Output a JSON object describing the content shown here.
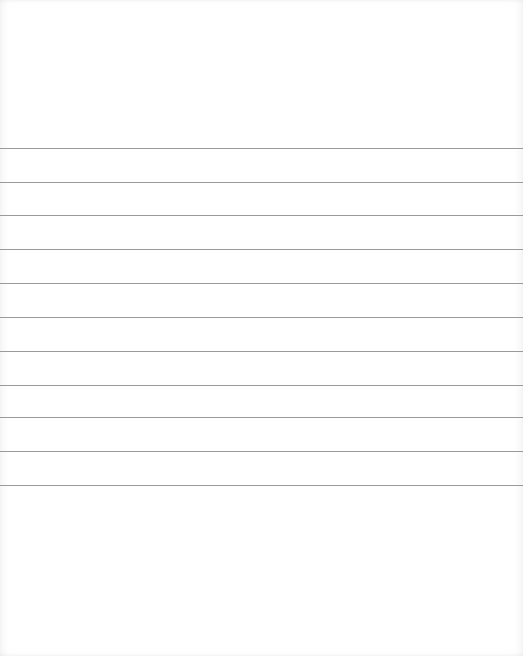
{
  "paper": {
    "type": "lined",
    "background_color": "#ffffff",
    "line_color": "#9a9a9a",
    "rule_positions_y": [
      148,
      182,
      215,
      249,
      283,
      317,
      351,
      385,
      417,
      451,
      485
    ]
  }
}
